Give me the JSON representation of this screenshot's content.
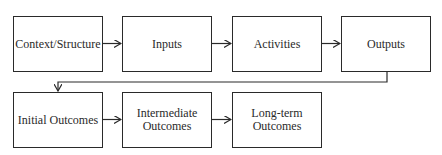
{
  "diagram": {
    "type": "flowchart",
    "row1": [
      {
        "id": "context",
        "label": "Context/Structure"
      },
      {
        "id": "inputs",
        "label": "Inputs"
      },
      {
        "id": "activities",
        "label": "Activities"
      },
      {
        "id": "outputs",
        "label": "Outputs"
      }
    ],
    "row2": [
      {
        "id": "initial",
        "label": "Initial Outcomes"
      },
      {
        "id": "intermediate",
        "label": "Intermediate Outcomes"
      },
      {
        "id": "longterm",
        "label": "Long-term Outcomes"
      }
    ],
    "edges": [
      [
        "context",
        "inputs"
      ],
      [
        "inputs",
        "activities"
      ],
      [
        "activities",
        "outputs"
      ],
      [
        "outputs",
        "initial"
      ],
      [
        "initial",
        "intermediate"
      ],
      [
        "intermediate",
        "longterm"
      ]
    ],
    "colors": {
      "stroke": "#2a2a2a",
      "background": "#ffffff"
    }
  }
}
